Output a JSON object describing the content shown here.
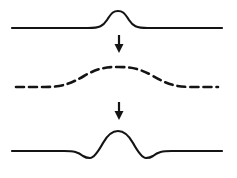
{
  "figure": {
    "background_color": "#ffffff",
    "stroke_color": "#141414",
    "width": 237,
    "height": 178,
    "panels": [
      {
        "name": "top-trace",
        "label": "original single peak on flat baseline",
        "line_style": "solid",
        "stroke_width": 2.2,
        "baseline_y": 28,
        "baseline_x_start": 12,
        "baseline_x_end": 222,
        "peak_x": 118,
        "peak_y": 11,
        "peak_height": 17,
        "peak_half_width": 17,
        "undershoot": false,
        "path": "M 12 28 L 88 28 C 100 28 103 26 107 20 C 112 12 114 11 118 11 C 122 11 124 12 129 20 C 133 26 136 28 148 28 L 222 28"
      },
      {
        "name": "middle-trace",
        "label": "broadened / smoothed peak",
        "line_style": "dashed",
        "dash_array": "8 5",
        "stroke_width": 2.6,
        "baseline_y": 87,
        "baseline_x_start": 16,
        "baseline_x_end": 218,
        "peak_x": 118,
        "peak_y": 67,
        "peak_height": 20,
        "peak_half_width": 40,
        "undershoot": false,
        "path": "M 16 87 L 44 87 C 62 87 70 84 84 76 C 98 68 106 67 118 67 C 130 67 139 68 153 76 C 167 84 175 87 192 87 L 218 87"
      },
      {
        "name": "bottom-trace",
        "label": "sharpened peak with negative side lobes",
        "line_style": "solid",
        "stroke_width": 2.2,
        "baseline_y": 151,
        "baseline_x_start": 12,
        "baseline_x_end": 222,
        "peak_x": 118,
        "peak_y": 131,
        "peak_height": 20,
        "peak_half_width": 13,
        "undershoot": true,
        "undershoot_left_x": 90,
        "undershoot_right_x": 146,
        "undershoot_y": 158,
        "undershoot_depth": 7,
        "path": "M 12 151 L 64 151 C 74 151 78 152 83 156 C 86 158 88 158 90 158 C 94 158 98 152 103 143 C 108 134 113 131 118 131 C 123 131 128 134 133 143 C 138 152 142 158 146 158 C 148 158 150 158 153 156 C 158 152 162 151 172 151 L 222 151"
      }
    ],
    "arrows": [
      {
        "name": "arrow-top-to-middle",
        "direction": "down",
        "x": 119,
        "y_start": 35,
        "y_end": 53,
        "shaft_width": 2.2,
        "head_width": 9,
        "head_length": 9
      },
      {
        "name": "arrow-middle-to-bottom",
        "direction": "down",
        "x": 119,
        "y_start": 102,
        "y_end": 120,
        "shaft_width": 2.2,
        "head_width": 9,
        "head_length": 9
      }
    ]
  }
}
